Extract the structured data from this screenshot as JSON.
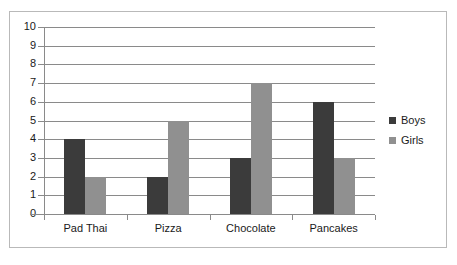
{
  "chart_data": {
    "type": "bar",
    "title": "",
    "xlabel": "",
    "ylabel": "",
    "ylim": [
      0,
      10
    ],
    "yticks": [
      "0",
      "1",
      "2",
      "3",
      "4",
      "5",
      "6",
      "7",
      "8",
      "9",
      "10"
    ],
    "grid": true,
    "legend_position": "right",
    "categories": [
      "Pad Thai",
      "Pizza",
      "Chocolate",
      "Pancakes"
    ],
    "series": [
      {
        "name": "Boys",
        "color": "#3b3b3b",
        "values": [
          4,
          2,
          3,
          6
        ]
      },
      {
        "name": "Girls",
        "color": "#909090",
        "values": [
          2,
          5,
          7,
          3
        ]
      }
    ]
  },
  "legend": {
    "items": [
      {
        "label": "Boys",
        "color": "#3b3b3b"
      },
      {
        "label": "Girls",
        "color": "#909090"
      }
    ]
  },
  "colors": {
    "boys": "#3b3b3b",
    "girls": "#909090",
    "gridline": "#8a8a8a",
    "border": "#b9b9b9",
    "text": "#1a1a1a",
    "background": "#ffffff"
  }
}
